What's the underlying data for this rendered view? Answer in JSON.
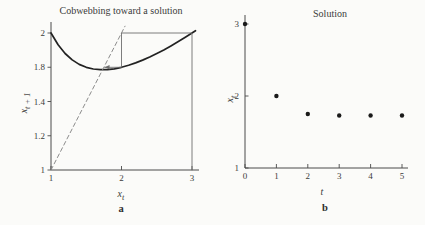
{
  "figure": {
    "background": "#fbfbf9",
    "panels": [
      {
        "title": "Cobwebbing toward a solution",
        "panel_label": "a",
        "xlabel": {
          "base": "x",
          "sub": "t"
        },
        "ylabel": {
          "base": "x",
          "sub": "t + 1"
        }
      },
      {
        "title": "Solution",
        "panel_label": "b",
        "xlabel": {
          "base": "t",
          "sub": ""
        },
        "ylabel": {
          "base": "x",
          "sub": "t"
        }
      }
    ],
    "colors": {
      "curve": "#222222",
      "cobweb": "#6e6e6e",
      "dashed": "#8c8c8c",
      "axis": "#4a4a4a",
      "text": "#3b3b3b",
      "point": "#1a1a1a"
    }
  },
  "chart_data": [
    {
      "type": "line",
      "panel": "a",
      "title": "Cobwebbing toward a solution",
      "xlabel": "x_t",
      "ylabel": "x_t+1",
      "xlim": [
        1,
        3
      ],
      "ylim": [
        1,
        2
      ],
      "x_ticks": [
        "1",
        "2",
        "3"
      ],
      "y_tick_labels_top_to_bottom": [
        "2",
        "1.8",
        "1.4",
        "1.2",
        "1"
      ],
      "grid": false,
      "fixed_point": [
        1.732,
        1.732
      ],
      "series": [
        {
          "name": "updating-function-curve",
          "style": "curve",
          "points": [
            [
              1,
              2
            ],
            [
              1.1,
              1.914
            ],
            [
              1.2,
              1.85
            ],
            [
              1.3,
              1.804
            ],
            [
              1.4,
              1.771
            ],
            [
              1.5,
              1.75
            ],
            [
              1.6,
              1.737
            ],
            [
              1.7,
              1.732
            ],
            [
              1.8,
              1.733
            ],
            [
              1.9,
              1.739
            ],
            [
              2,
              1.75
            ],
            [
              2.1,
              1.764
            ],
            [
              2.2,
              1.782
            ],
            [
              2.3,
              1.802
            ],
            [
              2.4,
              1.825
            ],
            [
              2.5,
              1.85
            ],
            [
              2.6,
              1.877
            ],
            [
              2.7,
              1.906
            ],
            [
              2.8,
              1.936
            ],
            [
              2.9,
              1.967
            ],
            [
              3,
              2
            ],
            [
              3.05,
              2.017
            ]
          ]
        },
        {
          "name": "diagonal-identity-line",
          "style": "dashed",
          "points": [
            [
              1,
              1
            ],
            [
              2.05,
              2.05
            ]
          ]
        },
        {
          "name": "cobweb-steps",
          "style": "cobweb",
          "arrow_end": true,
          "points": [
            [
              3,
              1
            ],
            [
              3,
              2
            ],
            [
              2,
              2
            ],
            [
              2,
              1.75
            ],
            [
              1.76,
              1.75
            ]
          ]
        }
      ]
    },
    {
      "type": "scatter",
      "panel": "b",
      "title": "Solution",
      "xlabel": "t",
      "ylabel": "x_t",
      "xlim": [
        0,
        5
      ],
      "ylim": [
        1,
        3
      ],
      "x_ticks": [
        "0",
        "1",
        "2",
        "3",
        "4",
        "5"
      ],
      "y_ticks": [
        "3",
        "2",
        "1"
      ],
      "grid": false,
      "x": [
        0,
        1,
        2,
        3,
        4,
        5
      ],
      "y": [
        3,
        2,
        1.75,
        1.73,
        1.73,
        1.73
      ]
    }
  ]
}
